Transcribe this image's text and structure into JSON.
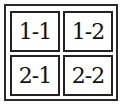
{
  "grid": {
    "rows": 2,
    "cols": 2,
    "cells": [
      {
        "label": "1-1"
      },
      {
        "label": "1-2"
      },
      {
        "label": "2-1"
      },
      {
        "label": "2-2"
      }
    ]
  },
  "colors": {
    "border": "#222222",
    "background": "#ffffff",
    "text": "#111111"
  }
}
